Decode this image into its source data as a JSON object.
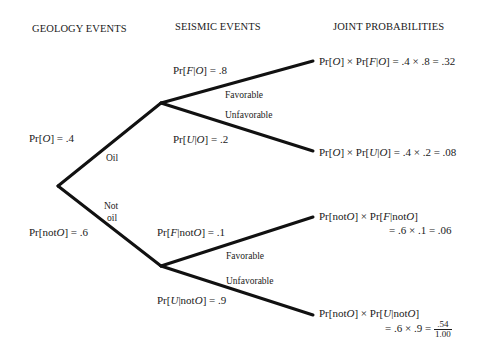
{
  "headers": {
    "geology": "GEOLOGY EVENTS",
    "seismic": "SEISMIC EVENTS",
    "joint": "JOINT PROBABILITIES"
  },
  "geology": {
    "oil": {
      "prob_label": "Pr[O] = .4",
      "branch_label": "Oil"
    },
    "not_oil": {
      "prob_label": "Pr[not O] = .6",
      "branch_label_line1": "Not",
      "branch_label_line2": "oil"
    }
  },
  "seismic": {
    "given_oil": {
      "favorable": {
        "prob_label": "Pr[F|O] = .8",
        "branch_label": "Favorable"
      },
      "unfavorable": {
        "prob_label": "Pr[U|O] = .2",
        "branch_label": "Unfavorable"
      }
    },
    "given_not_oil": {
      "favorable": {
        "prob_label": "Pr[F|not O] = .1",
        "branch_label": "Favorable"
      },
      "unfavorable": {
        "prob_label": "Pr[U|not O] = .9",
        "branch_label": "Unfavorable"
      }
    }
  },
  "joint": {
    "oil_favorable": "Pr[O] × Pr[F|O] = .4 × .8 = .32",
    "oil_unfavorable": "Pr[O] × Pr[U|O] = .4 × .2 = .08",
    "notoil_favorable_line1": "Pr[not O] × Pr[F|not O]",
    "notoil_favorable_line2": "= .6 × .1 = .06",
    "notoil_unfavorable_line1": "Pr[not O] × Pr[U|not O]",
    "notoil_unfavorable_line2": "= .6 × .9 =",
    "notoil_unfavorable_value": ".54",
    "total": "1.00"
  },
  "colors": {
    "line": "#111111",
    "text": "#1a1a1a",
    "background": "#ffffff"
  }
}
